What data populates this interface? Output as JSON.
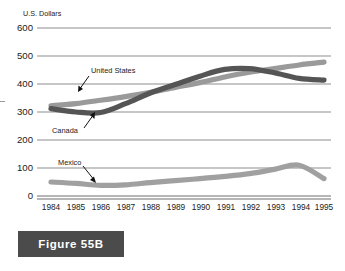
{
  "figure": {
    "caption": "Figure 55B"
  },
  "chart_data": {
    "type": "line",
    "title": "",
    "subtitle": "",
    "xlabel": "",
    "ylabel": "U.S. Dollars",
    "grid": true,
    "legend_position": "inline-annotations",
    "xlim": [
      1984,
      1995
    ],
    "ylim": [
      0,
      600
    ],
    "yticks": [
      0,
      100,
      200,
      300,
      400,
      500,
      600
    ],
    "ytick_labels": [
      "0",
      "100",
      "200",
      "300",
      "400",
      "500",
      "600"
    ],
    "categories": [
      "1984",
      "1985",
      "1986",
      "1987",
      "1988",
      "1989",
      "1990",
      "1991",
      "1992",
      "1993",
      "1994",
      "1995"
    ],
    "x": [
      1984,
      1985,
      1986,
      1987,
      1988,
      1989,
      1990,
      1991,
      1992,
      1993,
      1994,
      1995
    ],
    "series": [
      {
        "name": "United States",
        "color": "#9a9a9a",
        "values": [
          322,
          330,
          342,
          355,
          370,
          388,
          405,
          425,
          442,
          455,
          468,
          478
        ]
      },
      {
        "name": "Canada",
        "color": "#555555",
        "values": [
          312,
          300,
          298,
          330,
          368,
          398,
          428,
          452,
          455,
          440,
          420,
          414
        ]
      },
      {
        "name": "Mexico",
        "color": "#a0a0a0",
        "values": [
          50,
          45,
          38,
          40,
          48,
          55,
          62,
          70,
          80,
          95,
          110,
          62
        ]
      }
    ],
    "annotations": [
      {
        "label": "United States",
        "target_series": "United States"
      },
      {
        "label": "Canada",
        "target_series": "Canada"
      },
      {
        "label": "Mexico",
        "target_series": "Mexico"
      }
    ]
  }
}
